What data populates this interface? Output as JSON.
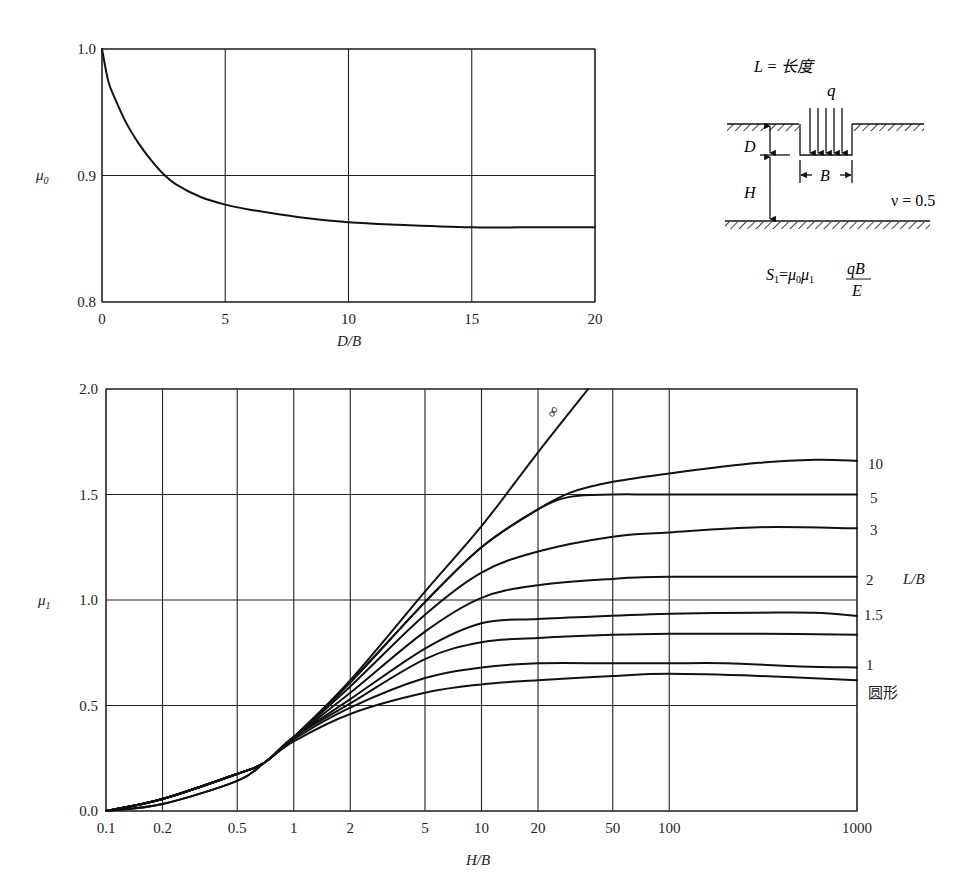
{
  "chart_data": [
    {
      "type": "line",
      "title": "",
      "xlabel": "D/B",
      "ylabel": "μ0",
      "xlim": [
        0,
        20
      ],
      "ylim": [
        0.8,
        1.0
      ],
      "x_ticks": [
        "0",
        "5",
        "10",
        "15",
        "20"
      ],
      "y_ticks": [
        "0.8",
        "0.9",
        "1.0"
      ],
      "grid": true,
      "series": [
        {
          "name": "μ0",
          "x": [
            0,
            0.25,
            0.5,
            1,
            1.5,
            2,
            2.5,
            3,
            4,
            5,
            6,
            8,
            10,
            12,
            15,
            17,
            20
          ],
          "values": [
            1.0,
            0.975,
            0.962,
            0.941,
            0.925,
            0.912,
            0.901,
            0.893,
            0.883,
            0.877,
            0.873,
            0.867,
            0.863,
            0.861,
            0.859,
            0.859,
            0.859
          ]
        }
      ]
    },
    {
      "type": "line",
      "title": "",
      "xlabel": "H/B",
      "ylabel": "μ1",
      "xscale": "log",
      "xlim": [
        0.1,
        1000
      ],
      "ylim": [
        0.0,
        2.0
      ],
      "x_ticks": [
        "0.1",
        "0.2",
        "0.5",
        "1",
        "2",
        "5",
        "10",
        "20",
        "50",
        "100",
        "1000"
      ],
      "y_ticks": [
        "0.0",
        "0.5",
        "1.0",
        "1.5",
        "2.0"
      ],
      "grid": true,
      "legend_title": "L/B",
      "series": [
        {
          "name": "∞",
          "label": "∞",
          "x": [
            0.1,
            0.2,
            0.5,
            0.7,
            1,
            2,
            5,
            10,
            20,
            37
          ],
          "values": [
            0.0,
            0.057,
            0.176,
            0.23,
            0.35,
            0.62,
            1.04,
            1.35,
            1.7,
            2.0
          ]
        },
        {
          "name": "10",
          "label": "10",
          "x": [
            0.1,
            0.2,
            0.5,
            0.7,
            1,
            2,
            5,
            10,
            20,
            30,
            50,
            100,
            300,
            600,
            1000
          ],
          "values": [
            0.0,
            0.057,
            0.176,
            0.23,
            0.35,
            0.61,
            0.99,
            1.25,
            1.43,
            1.51,
            1.56,
            1.6,
            1.65,
            1.665,
            1.66
          ]
        },
        {
          "name": "5",
          "label": "5",
          "x": [
            0.1,
            0.2,
            0.5,
            0.7,
            1,
            2,
            5,
            10,
            20,
            30,
            50,
            100,
            1000
          ],
          "values": [
            0.0,
            0.057,
            0.176,
            0.23,
            0.35,
            0.61,
            0.99,
            1.25,
            1.43,
            1.49,
            1.5,
            1.5,
            1.5
          ]
        },
        {
          "name": "3",
          "label": "3",
          "x": [
            0.1,
            0.2,
            0.5,
            0.7,
            1,
            2,
            5,
            10,
            20,
            50,
            100,
            300,
            1000
          ],
          "values": [
            0.0,
            0.057,
            0.176,
            0.23,
            0.35,
            0.59,
            0.93,
            1.13,
            1.23,
            1.3,
            1.32,
            1.345,
            1.34
          ]
        },
        {
          "name": "2",
          "label": "2",
          "x": [
            0.1,
            0.2,
            0.5,
            0.7,
            1,
            2,
            5,
            10,
            20,
            50,
            100,
            1000
          ],
          "values": [
            0.0,
            0.057,
            0.176,
            0.23,
            0.35,
            0.56,
            0.85,
            1.01,
            1.07,
            1.1,
            1.11,
            1.11
          ]
        },
        {
          "name": "1.5",
          "label": "1.5",
          "x": [
            0.1,
            0.2,
            0.5,
            0.7,
            1,
            2,
            5,
            10,
            20,
            50,
            100,
            300,
            600,
            1000
          ],
          "values": [
            0.0,
            0.057,
            0.176,
            0.23,
            0.35,
            0.53,
            0.77,
            0.89,
            0.91,
            0.925,
            0.935,
            0.94,
            0.94,
            0.925
          ]
        },
        {
          "name": "1.2",
          "label": "",
          "x": [
            0.1,
            0.2,
            0.5,
            0.7,
            1,
            2,
            5,
            10,
            20,
            50,
            100,
            300,
            1000
          ],
          "values": [
            0.0,
            0.057,
            0.176,
            0.23,
            0.35,
            0.51,
            0.72,
            0.8,
            0.82,
            0.835,
            0.84,
            0.84,
            0.835
          ]
        },
        {
          "name": "1",
          "label": "1",
          "x": [
            0.1,
            0.2,
            0.5,
            0.7,
            1,
            2,
            5,
            10,
            20,
            50,
            100,
            200,
            500,
            1000
          ],
          "values": [
            0.0,
            0.033,
            0.143,
            0.23,
            0.34,
            0.49,
            0.63,
            0.68,
            0.7,
            0.7,
            0.7,
            0.7,
            0.685,
            0.68
          ]
        },
        {
          "name": "圆形",
          "label": "圆形",
          "x": [
            0.1,
            0.2,
            0.5,
            0.7,
            1,
            2,
            5,
            10,
            20,
            50,
            100,
            300,
            1000
          ],
          "values": [
            0.0,
            0.033,
            0.143,
            0.23,
            0.33,
            0.46,
            0.56,
            0.6,
            0.62,
            0.64,
            0.65,
            0.64,
            0.62
          ]
        }
      ]
    }
  ],
  "diagram": {
    "length_label": "L = 长度",
    "load_label": "q",
    "depth_label": "D",
    "layer_label": "H",
    "width_label": "B",
    "poisson_label": "ν = 0.5",
    "formula": {
      "lhs": "S",
      "lhs_sub": "1",
      "eq": "=",
      "mu0": "μ",
      "mu0_sub": "0",
      "mu1": "μ",
      "mu1_sub": "1",
      "numerator": "qB",
      "denominator": "E"
    }
  },
  "labels": {
    "top_ylabel_main": "μ",
    "top_ylabel_sub": "0",
    "top_xlabel": "D/B",
    "bottom_ylabel_main": "μ",
    "bottom_ylabel_sub": "1",
    "bottom_xlabel": "H/B",
    "legend_title": "L/B"
  }
}
